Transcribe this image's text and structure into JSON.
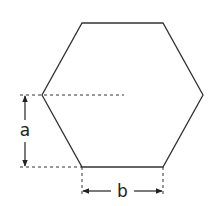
{
  "diagram": {
    "shape": "regular hexagon",
    "colors": {
      "stroke": "#333333",
      "dash": "#333333",
      "background": "#ffffff"
    },
    "vertices": [
      [
        82,
        23
      ],
      [
        163,
        23
      ],
      [
        203,
        95
      ],
      [
        163,
        167
      ],
      [
        82,
        167
      ],
      [
        42,
        95
      ]
    ],
    "labels": {
      "a": "a",
      "b": "b"
    },
    "dimensions": [
      {
        "name": "a",
        "description": "vertical distance from left vertex to bottom edge"
      },
      {
        "name": "b",
        "description": "length of bottom edge"
      }
    ]
  }
}
